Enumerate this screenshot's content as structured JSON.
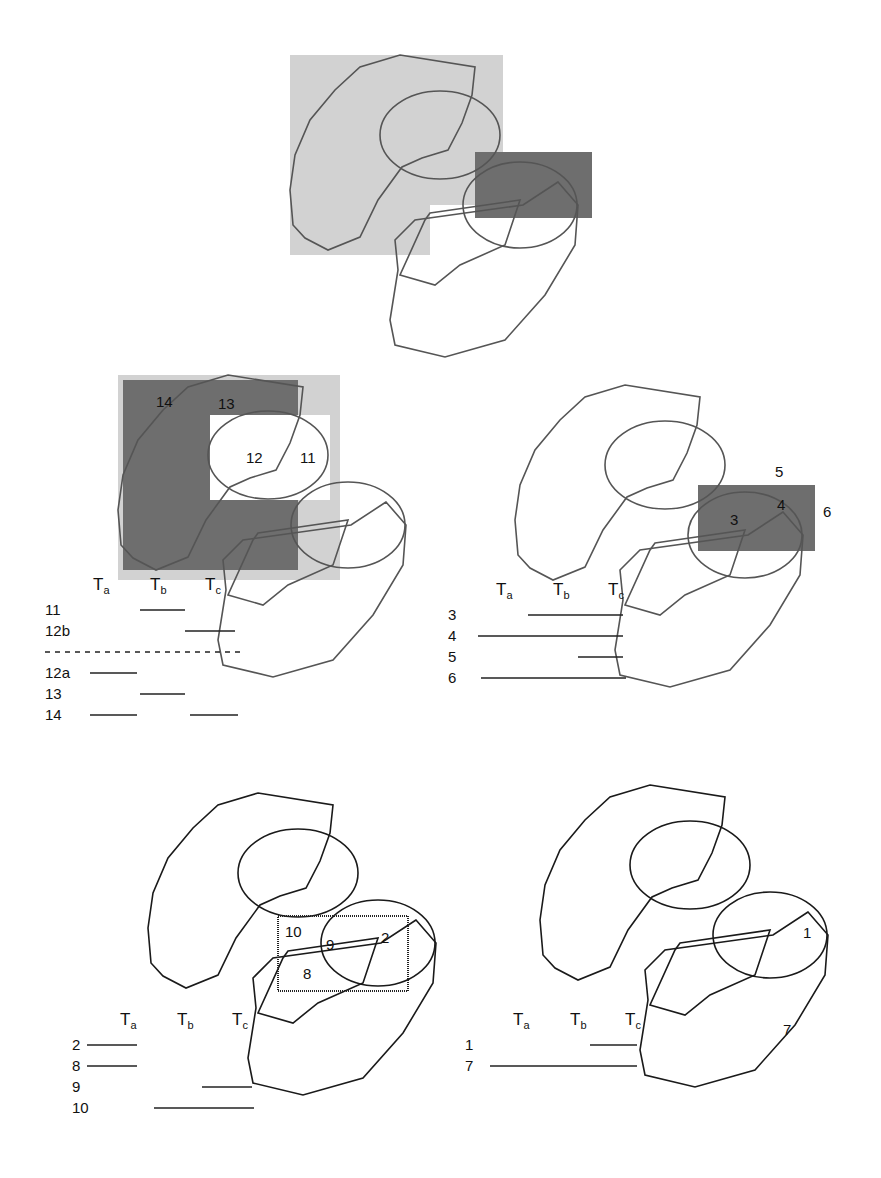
{
  "colors": {
    "light_shade": "#cfcfcf",
    "dark_shade": "#6e6e6e",
    "stroke_gray": "#555555",
    "stroke_black": "#1a1a1a"
  },
  "timeline_headers": [
    "T",
    "T",
    "T"
  ],
  "timeline_header_subscripts": [
    "a",
    "b",
    "c"
  ],
  "panels": [
    {
      "id": "top",
      "offset": [
        290,
        55
      ],
      "stroke": "#555555",
      "shades": [
        {
          "x": 0,
          "y": 0,
          "w": 213,
          "h": 200,
          "fill": "#d2d2d2"
        },
        {
          "x": 140,
          "y": 150,
          "w": 73,
          "h": 50,
          "fill": "#ffffff"
        },
        {
          "x": 185,
          "y": 97,
          "w": 117,
          "h": 66,
          "fill": "#6e6e6e"
        }
      ],
      "region_labels": [],
      "timeline": null
    },
    {
      "id": "middle-left",
      "offset": [
        118,
        375
      ],
      "stroke": "#555555",
      "shades": [
        {
          "x": 0,
          "y": 0,
          "w": 222,
          "h": 205,
          "fill": "#d2d2d2"
        },
        {
          "x": 5,
          "y": 5,
          "w": 175,
          "h": 190,
          "fill": "#6e6e6e"
        },
        {
          "x": 92,
          "y": 40,
          "w": 120,
          "h": 85,
          "fill": "#ffffff"
        }
      ],
      "region_labels": [
        {
          "text": "14",
          "x": 38,
          "y": 32
        },
        {
          "text": "13",
          "x": 100,
          "y": 34
        },
        {
          "text": "12",
          "x": 128,
          "y": 88
        },
        {
          "text": "11",
          "x": 182,
          "y": 88
        }
      ],
      "timeline": {
        "origin": [
          45,
          610
        ],
        "rows": [
          {
            "label": "11",
            "segments": [
              [
                95,
                140
              ]
            ],
            "dashed": false
          },
          {
            "label": "12b",
            "segments": [
              [
                140,
                190
              ]
            ],
            "dashed": false
          },
          {
            "label": "",
            "segments": [
              [
                0,
                200
              ]
            ],
            "dashed": true
          },
          {
            "label": "12a",
            "segments": [
              [
                45,
                92
              ]
            ],
            "dashed": false
          },
          {
            "label": "13",
            "segments": [
              [
                95,
                140
              ]
            ],
            "dashed": false
          },
          {
            "label": "14",
            "segments": [
              [
                45,
                92
              ],
              [
                145,
                193
              ]
            ],
            "dashed": false
          }
        ]
      }
    },
    {
      "id": "middle-right",
      "offset": [
        515,
        385
      ],
      "stroke": "#555555",
      "shades": [
        {
          "x": 183,
          "y": 100,
          "w": 117,
          "h": 66,
          "fill": "#6e6e6e"
        }
      ],
      "region_labels": [
        {
          "text": "5",
          "x": 260,
          "y": 92
        },
        {
          "text": "6",
          "x": 308,
          "y": 132
        },
        {
          "text": "4",
          "x": 262,
          "y": 125
        },
        {
          "text": "3",
          "x": 215,
          "y": 140
        }
      ],
      "timeline": {
        "origin": [
          448,
          615
        ],
        "rows": [
          {
            "label": "3",
            "segments": [
              [
                80,
                175
              ]
            ],
            "dashed": false
          },
          {
            "label": "4",
            "segments": [
              [
                30,
                175
              ]
            ],
            "dashed": false
          },
          {
            "label": "5",
            "segments": [
              [
                130,
                175
              ]
            ],
            "dashed": false
          },
          {
            "label": "6",
            "segments": [
              [
                33,
                178
              ]
            ],
            "dashed": false
          }
        ]
      }
    },
    {
      "id": "bottom-left",
      "offset": [
        148,
        793
      ],
      "stroke": "#1a1a1a",
      "shades": [],
      "box": {
        "x": 130,
        "y": 123,
        "w": 130,
        "h": 75
      },
      "region_labels": [
        {
          "text": "10",
          "x": 137,
          "y": 144
        },
        {
          "text": "9",
          "x": 178,
          "y": 157
        },
        {
          "text": "2",
          "x": 233,
          "y": 150
        },
        {
          "text": "8",
          "x": 155,
          "y": 186
        }
      ],
      "timeline": {
        "origin": [
          72,
          1045
        ],
        "rows": [
          {
            "label": "2",
            "segments": [
              [
                15,
                65
              ]
            ],
            "dashed": false
          },
          {
            "label": "8",
            "segments": [
              [
                15,
                65
              ]
            ],
            "dashed": false
          },
          {
            "label": "9",
            "segments": [
              [
                130,
                180
              ]
            ],
            "dashed": false
          },
          {
            "label": "10",
            "segments": [
              [
                82,
                182
              ]
            ],
            "dashed": false
          }
        ]
      }
    },
    {
      "id": "bottom-right",
      "offset": [
        540,
        785
      ],
      "stroke": "#1a1a1a",
      "shades": [],
      "region_labels": [
        {
          "text": "1",
          "x": 263,
          "y": 153
        },
        {
          "text": "7",
          "x": 243,
          "y": 250
        }
      ],
      "timeline": {
        "origin": [
          465,
          1045
        ],
        "rows": [
          {
            "label": "1",
            "segments": [
              [
                125,
                172
              ]
            ],
            "dashed": false
          },
          {
            "label": "7",
            "segments": [
              [
                25,
                172
              ]
            ],
            "dashed": false
          }
        ]
      }
    }
  ]
}
